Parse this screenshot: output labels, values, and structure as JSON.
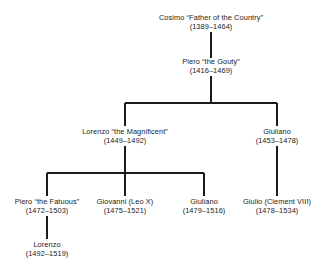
{
  "diagram": {
    "type": "family-tree",
    "line_color": "#1b1b1b",
    "text_color": "#1b1b1b",
    "background": "#ffffff",
    "nodes": [
      {
        "id": "cosimo",
        "name": "Cosimo “Father of the Country”",
        "dates": "(1389–1464)",
        "generation": 1,
        "x": 211,
        "y": 14
      },
      {
        "id": "piero-gouty",
        "name": "Piero “the Gouty”",
        "dates": "(1416–1469)",
        "generation": 2,
        "x": 211,
        "y": 58
      },
      {
        "id": "lorenzo-magnificent",
        "name": "Lorenzo “the Magnificent”",
        "dates": "(1449–1492)",
        "generation": 3,
        "x": 125,
        "y": 128
      },
      {
        "id": "giuliano-1453",
        "name": "Giuliano",
        "dates": "(1453–1478)",
        "generation": 3,
        "x": 277,
        "y": 128
      },
      {
        "id": "piero-fatuous",
        "name": "Piero “the Fatuous”",
        "dates": "(1472–1503)",
        "generation": 4,
        "x": 47,
        "y": 198
      },
      {
        "id": "giovanni-leo-x",
        "name": "Giovanni (Leo X)",
        "dates": "(1475–1521)",
        "generation": 4,
        "x": 125,
        "y": 198
      },
      {
        "id": "giuliano-1479",
        "name": "Giuliano",
        "dates": "(1479–1516)",
        "generation": 4,
        "x": 204,
        "y": 198
      },
      {
        "id": "giulio-clement-viii",
        "name": "Giulio (Clement VIII)",
        "dates": "(1478–1534)",
        "generation": 4,
        "x": 277,
        "y": 198
      },
      {
        "id": "lorenzo-1492",
        "name": "Lorenzo",
        "dates": "(1492–1519)",
        "generation": 5,
        "x": 47,
        "y": 241
      }
    ],
    "connectors": [
      {
        "id": "cosimo-to-piero",
        "from": "cosimo",
        "to": "piero-gouty",
        "shape": "vertical"
      },
      {
        "id": "piero-stem-down",
        "from": "piero-gouty",
        "to": "gen3-bar",
        "shape": "vertical"
      },
      {
        "id": "gen3-sibling-bar",
        "shape": "horizontal",
        "children": [
          "lorenzo-magnificent",
          "giuliano-1453"
        ]
      },
      {
        "id": "lorenzo-stem-down",
        "from": "lorenzo-magnificent",
        "to": "gen4-bar",
        "shape": "vertical"
      },
      {
        "id": "gen4-sibling-bar",
        "shape": "horizontal",
        "children": [
          "piero-fatuous",
          "giovanni-leo-x",
          "giuliano-1479"
        ]
      },
      {
        "id": "giuliano-to-giulio",
        "from": "giuliano-1453",
        "to": "giulio-clement-viii",
        "shape": "vertical"
      },
      {
        "id": "piero-fatuous-to-lorenzo",
        "from": "piero-fatuous",
        "to": "lorenzo-1492",
        "shape": "vertical"
      }
    ]
  }
}
